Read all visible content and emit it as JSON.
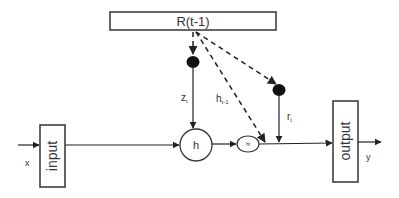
{
  "diagram": {
    "recurrent_box": {
      "label": "R(t-1)"
    },
    "input_box": {
      "label": "input"
    },
    "output_box": {
      "label": "output"
    },
    "input_signal": {
      "label": "x"
    },
    "output_signal": {
      "label": "y"
    },
    "hidden_node": {
      "label": "h"
    },
    "candidate_node": {
      "label": "ht"
    },
    "edges": {
      "z_gate": {
        "label": "z",
        "subscript": "t"
      },
      "h_prev": {
        "label": "h",
        "subscript": "t-1"
      },
      "r_gate": {
        "label": "r",
        "subscript": "t"
      }
    }
  }
}
